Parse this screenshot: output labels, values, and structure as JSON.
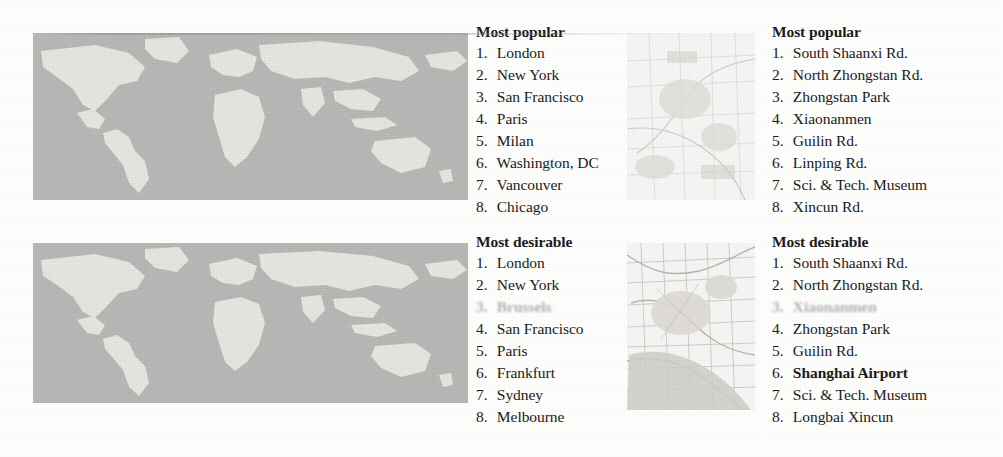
{
  "figure": {
    "kind": "scanned-figure-two-maps-with-ranked-lists",
    "maps": [
      {
        "name": "world-map-popular",
        "caption_group": "Most popular",
        "region": "world",
        "x": 33,
        "y": 33,
        "w": 435,
        "h": 167
      },
      {
        "name": "shanghai-map-popular",
        "caption_group": "Most popular",
        "region": "shanghai",
        "x": 627,
        "y": 33,
        "w": 128,
        "h": 167
      },
      {
        "name": "world-map-desirable",
        "caption_group": "Most desirable",
        "region": "world",
        "x": 33,
        "y": 243,
        "w": 435,
        "h": 160
      },
      {
        "name": "shanghai-map-desirable",
        "caption_group": "Most desirable",
        "region": "shanghai",
        "x": 627,
        "y": 243,
        "w": 128,
        "h": 167
      }
    ]
  },
  "columns": {
    "world_popular": {
      "heading": "Most popular",
      "items": [
        {
          "num": "1.",
          "label": "London",
          "style": "normal"
        },
        {
          "num": "2.",
          "label": "New York",
          "style": "normal"
        },
        {
          "num": "3.",
          "label": "San Francisco",
          "style": "normal"
        },
        {
          "num": "4.",
          "label": "Paris",
          "style": "normal"
        },
        {
          "num": "5.",
          "label": "Milan",
          "style": "normal"
        },
        {
          "num": "6.",
          "label": "Washington, DC",
          "style": "normal"
        },
        {
          "num": "7.",
          "label": "Vancouver",
          "style": "normal"
        },
        {
          "num": "8.",
          "label": "Chicago",
          "style": "normal"
        }
      ]
    },
    "world_desirable": {
      "heading": "Most desirable",
      "items": [
        {
          "num": "1.",
          "label": "London",
          "style": "normal"
        },
        {
          "num": "2.",
          "label": "New York",
          "style": "normal"
        },
        {
          "num": "3.",
          "label": "Brussels",
          "style": "faded"
        },
        {
          "num": "4.",
          "label": "San Francisco",
          "style": "normal"
        },
        {
          "num": "5.",
          "label": "Paris",
          "style": "normal"
        },
        {
          "num": "6.",
          "label": "Frankfurt",
          "style": "normal"
        },
        {
          "num": "7.",
          "label": "Sydney",
          "style": "normal"
        },
        {
          "num": "8.",
          "label": "Melbourne",
          "style": "normal"
        }
      ]
    },
    "shanghai_popular": {
      "heading": "Most popular",
      "items": [
        {
          "num": "1.",
          "label": "South Shaanxi Rd.",
          "style": "normal"
        },
        {
          "num": "2.",
          "label": "North Zhongstan Rd.",
          "style": "normal"
        },
        {
          "num": "3.",
          "label": "Zhongstan Park",
          "style": "normal"
        },
        {
          "num": "4.",
          "label": "Xiaonanmen",
          "style": "normal"
        },
        {
          "num": "5.",
          "label": "Guilin Rd.",
          "style": "normal"
        },
        {
          "num": "6.",
          "label": "Linping Rd.",
          "style": "normal"
        },
        {
          "num": "7.",
          "label": "Sci. & Tech. Museum",
          "style": "normal"
        },
        {
          "num": "8.",
          "label": "Xincun Rd.",
          "style": "normal"
        }
      ]
    },
    "shanghai_desirable": {
      "heading": "Most desirable",
      "items": [
        {
          "num": "1.",
          "label": "South Shaanxi Rd.",
          "style": "normal"
        },
        {
          "num": "2.",
          "label": "North Zhongstan Rd.",
          "style": "normal"
        },
        {
          "num": "3.",
          "label": "Xiaonanmen",
          "style": "faded"
        },
        {
          "num": "4.",
          "label": "Zhongstan Park",
          "style": "normal"
        },
        {
          "num": "5.",
          "label": "Guilin Rd.",
          "style": "normal"
        },
        {
          "num": "6.",
          "label": "Shanghai Airport",
          "style": "bold"
        },
        {
          "num": "7.",
          "label": "Sci. & Tech. Museum",
          "style": "normal"
        },
        {
          "num": "8.",
          "label": "Longbai Xincun",
          "style": "normal"
        }
      ]
    }
  },
  "colors": {
    "page_background": "#fdfdfc",
    "world_ocean": "#b9b9b7",
    "world_land": "#e6e6e3",
    "shanghai_base": "#f4f4f2",
    "text": "#1a1a1a",
    "faded_text": "#696966"
  }
}
